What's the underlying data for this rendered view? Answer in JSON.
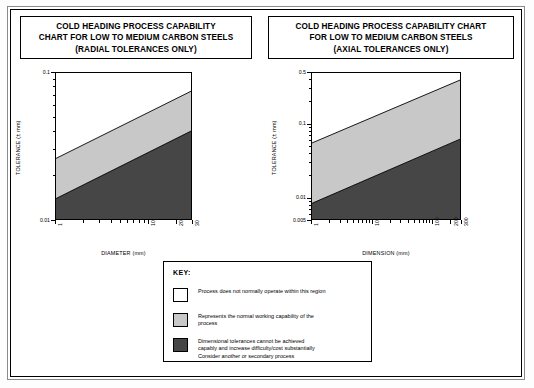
{
  "charts": [
    {
      "id": "radial",
      "title_lines": [
        "COLD HEADING PROCESS CAPABILITY",
        "CHART FOR LOW TO MEDIUM CARBON STEELS",
        "(RADIAL TOLERANCES ONLY)"
      ],
      "chart_data": {
        "type": "area",
        "title": "COLD HEADING PROCESS CAPABILITY CHART FOR LOW TO MEDIUM CARBON STEELS (RADIAL TOLERANCES ONLY)",
        "xlabel": "DIAMETER (mm)",
        "ylabel": "TOLERANCE (± mm)",
        "xscale": "log",
        "yscale": "log",
        "xlim": [
          1,
          30
        ],
        "ylim": [
          0.01,
          0.1
        ],
        "xticks": [
          1,
          10,
          20,
          30
        ],
        "xtick_labels": [
          "1",
          "10",
          "20",
          "30"
        ],
        "yticks": [
          0.01,
          0.1
        ],
        "ytick_labels": [
          "0.01",
          "0.1"
        ],
        "grid": false,
        "legend": "none",
        "series": [
          {
            "name": "upper boundary",
            "description": "boundary between white region and normal working capability band",
            "x": [
              1,
              30
            ],
            "y": [
              0.026,
              0.075
            ]
          },
          {
            "name": "lower boundary",
            "description": "boundary between normal working capability band and difficult region",
            "x": [
              1,
              30
            ],
            "y": [
              0.0138,
              0.04
            ]
          }
        ],
        "regions": [
          {
            "name": "Process does not normally operate within this region",
            "fill": "#ffffff"
          },
          {
            "name": "Represents the normal working capability of the process",
            "fill": "#c8c8c8"
          },
          {
            "name": "Dimensional tolerances cannot be achieved capably",
            "fill": "#464646"
          }
        ]
      }
    },
    {
      "id": "axial",
      "title_lines": [
        "COLD HEADING PROCESS CAPABILITY CHART",
        "FOR LOW TO MEDIUM CARBON STEELS",
        "(AXIAL TOLERANCES ONLY)"
      ],
      "chart_data": {
        "type": "area",
        "title": "COLD HEADING PROCESS CAPABILITY CHART FOR LOW TO MEDIUM CARBON STEELS (AXIAL TOLERANCES ONLY)",
        "xlabel": "DIMENSION (mm)",
        "ylabel": "TOLERANCE (± mm)",
        "xscale": "log",
        "yscale": "log",
        "xlim": [
          1,
          300
        ],
        "ylim": [
          0.005,
          0.5
        ],
        "xticks": [
          1,
          10,
          100,
          200,
          300
        ],
        "xtick_labels": [
          "1",
          "10",
          "100",
          "200",
          "300"
        ],
        "yticks": [
          0.005,
          0.01,
          0.1,
          0.5
        ],
        "ytick_labels": [
          "0.005",
          "0.01",
          "0.1",
          "0.5"
        ],
        "grid": false,
        "legend": "none",
        "series": [
          {
            "name": "upper boundary",
            "description": "boundary between white region and normal working capability band",
            "x": [
              1,
              300
            ],
            "y": [
              0.055,
              0.4
            ]
          },
          {
            "name": "lower boundary",
            "description": "boundary between normal working capability band and difficult region",
            "x": [
              1,
              300
            ],
            "y": [
              0.0082,
              0.062
            ]
          }
        ],
        "regions": [
          {
            "name": "Process does not normally operate within this region",
            "fill": "#ffffff"
          },
          {
            "name": "Represents the normal working capability of the process",
            "fill": "#c8c8c8"
          },
          {
            "name": "Dimensional tolerances cannot be achieved capably",
            "fill": "#464646"
          }
        ]
      }
    }
  ],
  "key": {
    "title": "KEY:",
    "entries": [
      {
        "swatch_color": "#ffffff",
        "lines": [
          "Process does not normally operate within this region"
        ]
      },
      {
        "swatch_color": "#c8c8c8",
        "lines": [
          "Represents the normal working capability of the",
          "process"
        ]
      },
      {
        "swatch_color": "#464646",
        "lines": [
          "Dimensional tolerances cannot be achieved",
          "capably and increase difficulty/cost substantially",
          "Consider another or secondary process"
        ]
      }
    ]
  },
  "colors": {
    "white_region": "#ffffff",
    "light_band": "#c8c8c8",
    "dark_band": "#464646",
    "line": "#000000"
  }
}
